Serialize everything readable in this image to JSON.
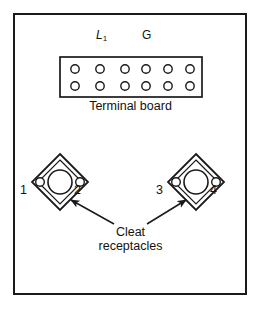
{
  "figure": {
    "background_color": "#ffffff",
    "line_color": "#1a1a1a",
    "text_color": "#111111"
  },
  "terminal_board": {
    "caption": "Terminal board",
    "terminal_labels": {
      "line1": "L",
      "line1_subscript": "1",
      "ground": "G"
    },
    "rows": 2,
    "columns": 6,
    "total_terminals": 12,
    "board": {
      "x": 60,
      "y": 57,
      "width": 142,
      "height": 40
    },
    "terminal_columns_x": [
      75,
      100,
      125,
      146,
      168,
      190
    ],
    "terminal_rows_y": [
      69,
      86
    ],
    "terminal_radius": 4.2
  },
  "receptacles": {
    "caption_line_1": "Cleat",
    "caption_line_2": "receptacles",
    "items": [
      {
        "name": "left-cleat-receptacle",
        "center_x": 60,
        "center_y": 182,
        "half_size": 28,
        "center_hole_radius": 12,
        "side_hole_radius": 4.3,
        "left_terminal_label": "1",
        "right_terminal_label": "2"
      },
      {
        "name": "right-cleat-receptacle",
        "center_x": 196,
        "center_y": 182,
        "half_size": 28,
        "center_hole_radius": 12,
        "side_hole_radius": 4.3,
        "left_terminal_label": "3",
        "right_terminal_label": "4"
      }
    ]
  },
  "annotations": {
    "leader_lines": [
      {
        "name": "left-leader-arrow",
        "from_x": 114,
        "from_y": 224,
        "to_x": 71,
        "to_y": 200
      },
      {
        "name": "right-leader-arrow",
        "from_x": 147,
        "from_y": 224,
        "to_x": 186,
        "to_y": 200
      }
    ]
  }
}
